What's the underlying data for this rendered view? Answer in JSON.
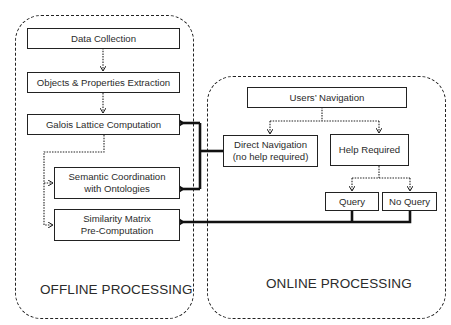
{
  "offline": {
    "label": "OFFLINE PROCESSING",
    "nodes": {
      "data_collection": "Data Collection",
      "extraction": "Objects & Properties Extraction",
      "galois": "Galois Lattice Computation",
      "semantic": "Semantic Coordination\nwith Ontologies",
      "similarity": "Similarity Matrix\nPre-Computation"
    }
  },
  "online": {
    "label": "ONLINE PROCESSING",
    "nodes": {
      "users_navigation": "Users’ Navigation",
      "direct_navigation": "Direct Navigation\n(no help required)",
      "help_required": "Help Required",
      "query": "Query",
      "no_query": "No Query"
    }
  },
  "edges": [
    {
      "from": "Data Collection",
      "to": "Objects & Properties Extraction",
      "style": "dotted"
    },
    {
      "from": "Objects & Properties Extraction",
      "to": "Galois Lattice Computation",
      "style": "dotted"
    },
    {
      "from": "Galois Lattice Computation",
      "to": "Semantic Coordination with Ontologies",
      "style": "dotted"
    },
    {
      "from": "Galois Lattice Computation",
      "to": "Similarity Matrix Pre-Computation",
      "style": "dotted"
    },
    {
      "from": "Users’ Navigation",
      "to": "Direct Navigation (no help required)",
      "style": "dotted"
    },
    {
      "from": "Users’ Navigation",
      "to": "Help Required",
      "style": "dotted"
    },
    {
      "from": "Help Required",
      "to": "Query",
      "style": "dotted"
    },
    {
      "from": "Help Required",
      "to": "No Query",
      "style": "dotted"
    },
    {
      "from": "Direct Navigation (no help required)",
      "to": "Galois Lattice Computation",
      "style": "thick"
    },
    {
      "from": "Direct Navigation (no help required)",
      "to": "Semantic Coordination with Ontologies",
      "style": "thick"
    },
    {
      "from": "Query",
      "to": "Similarity Matrix Pre-Computation",
      "style": "thick"
    },
    {
      "from": "No Query",
      "to": "Similarity Matrix Pre-Computation",
      "style": "thick"
    }
  ],
  "colors": {
    "line": "#222222",
    "text": "#2b2b2b",
    "background": "#ffffff"
  }
}
